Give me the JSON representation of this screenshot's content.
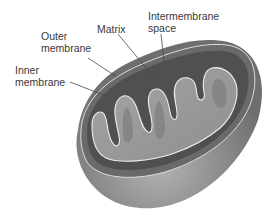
{
  "diagram": {
    "labels": {
      "outer_membrane": "Outer\nmembrane",
      "inner_membrane": "Inner\nmembrane",
      "matrix": "Matrix",
      "intermembrane_space": "Intermembrane\nspace"
    },
    "colors": {
      "outer_shell": "#7a7a7a",
      "outer_shell_light": "#a8a8a8",
      "intermembrane": "#555555",
      "matrix": "#9a9a9a",
      "matrix_light": "#b0b0b0",
      "membrane_line": "#efefef",
      "leader_line": "#4a4a4a",
      "text": "#3a3a3a"
    }
  }
}
